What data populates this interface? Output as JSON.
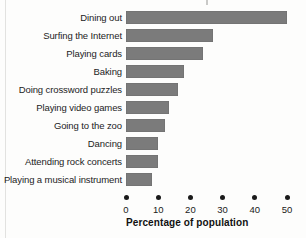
{
  "chart_data": {
    "type": "bar",
    "orientation": "horizontal",
    "title": "",
    "xlabel": "Percentage of population",
    "ylabel": "",
    "xlim": [
      0,
      50
    ],
    "xticks": [
      0,
      10,
      20,
      30,
      40,
      50
    ],
    "grid": false,
    "legend": null,
    "bar_color": "#7b7b7b",
    "categories": [
      "Dining out",
      "Surfing the Internet",
      "Playing cards",
      "Baking",
      "Doing crossword puzzles",
      "Playing video games",
      "Going to the zoo",
      "Dancing",
      "Attending rock concerts",
      "Playing a musical instrument"
    ],
    "values": [
      50,
      27,
      24,
      18,
      16,
      13.5,
      12,
      10,
      10,
      8
    ]
  },
  "colors": {
    "bar": "#7b7b7b",
    "text": "#1a1a1a",
    "background": "#fdfdfc"
  }
}
